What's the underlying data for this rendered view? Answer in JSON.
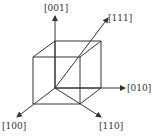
{
  "diagram": {
    "type": "crystallographic-directions-cube",
    "labels": {
      "z": "[001]",
      "body_diagonal": "[111]",
      "y": "[010]",
      "x": "[100]",
      "face_diagonal": "[110]"
    },
    "colors": {
      "line": "#333333",
      "background": "#ffffff"
    }
  }
}
